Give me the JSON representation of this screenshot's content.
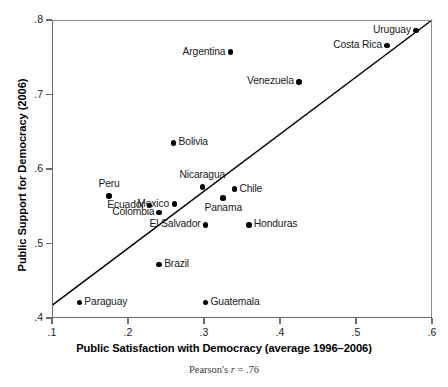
{
  "chart_data": {
    "type": "scatter",
    "title": "",
    "xlabel": "Public Satisfaction with Democracy (average 1996–2006)",
    "ylabel": "Public Support for Democracy (2006)",
    "caption_prefix": "Pearson's ",
    "caption_symbol": "r",
    "caption_suffix": " = .76",
    "correlation": 0.76,
    "xlim": [
      0.1,
      0.6
    ],
    "ylim": [
      0.4,
      0.8
    ],
    "xticks": [
      ".1",
      ".2",
      ".3",
      ".4",
      ".5",
      ".6"
    ],
    "xtick_values": [
      0.1,
      0.2,
      0.3,
      0.4,
      0.5,
      0.6
    ],
    "yticks": [
      ".8",
      ".7",
      ".6",
      ".5",
      ".4"
    ],
    "ytick_values": [
      0.8,
      0.7,
      0.6,
      0.5,
      0.4
    ],
    "grid": false,
    "legend": "none",
    "trendline": {
      "x0": 0.1,
      "y0": 0.417,
      "x1": 0.6,
      "y1": 0.8
    },
    "points": [
      {
        "label": "Uruguay",
        "x": 0.579,
        "y": 0.786,
        "label_side": "left"
      },
      {
        "label": "Costa Rica",
        "x": 0.541,
        "y": 0.766,
        "label_side": "left"
      },
      {
        "label": "Argentina",
        "x": 0.335,
        "y": 0.757,
        "label_side": "left"
      },
      {
        "label": "Venezuela",
        "x": 0.425,
        "y": 0.717,
        "label_side": "left"
      },
      {
        "label": "Bolivia",
        "x": 0.26,
        "y": 0.635,
        "label_side": "right"
      },
      {
        "label": "Nicaragua",
        "x": 0.298,
        "y": 0.576,
        "label_side": "above"
      },
      {
        "label": "Chile",
        "x": 0.34,
        "y": 0.573,
        "label_side": "right"
      },
      {
        "label": "Panama",
        "x": 0.325,
        "y": 0.561,
        "label_side": "below"
      },
      {
        "label": "Peru",
        "x": 0.175,
        "y": 0.564,
        "label_side": "above"
      },
      {
        "label": "Mexico",
        "x": 0.261,
        "y": 0.553,
        "label_side": "left"
      },
      {
        "label": "Ecuador",
        "x": 0.228,
        "y": 0.551,
        "label_side": "left"
      },
      {
        "label": "Colombia",
        "x": 0.241,
        "y": 0.542,
        "label_side": "left"
      },
      {
        "label": "El Salvador",
        "x": 0.302,
        "y": 0.525,
        "label_side": "left"
      },
      {
        "label": "Honduras",
        "x": 0.359,
        "y": 0.525,
        "label_side": "right"
      },
      {
        "label": "Brazil",
        "x": 0.241,
        "y": 0.472,
        "label_side": "right"
      },
      {
        "label": "Guatemala",
        "x": 0.302,
        "y": 0.421,
        "label_side": "right"
      },
      {
        "label": "Paraguay",
        "x": 0.136,
        "y": 0.421,
        "label_side": "right"
      }
    ]
  }
}
